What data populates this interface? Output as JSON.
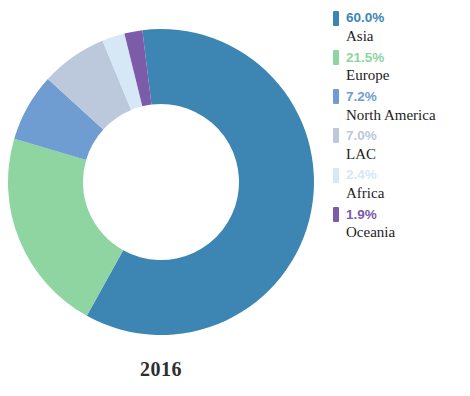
{
  "chart_data": {
    "type": "pie",
    "title": "",
    "subtitle": "",
    "year_label": "2016",
    "hole": 0.51,
    "start_angle_deg": -7.0,
    "direction": "clockwise",
    "legend_position": "right",
    "grid": false,
    "categories": [
      "Asia",
      "Europe",
      "North America",
      "LAC",
      "Africa",
      "Oceania"
    ],
    "values": [
      60.0,
      21.5,
      7.2,
      7.0,
      2.4,
      1.9
    ],
    "value_labels": [
      "60.0%",
      "21.5%",
      "7.2%",
      "7.0%",
      "2.4%",
      "1.9%"
    ],
    "colors": [
      "#3d86b4",
      "#8ed5a2",
      "#6f9dd1",
      "#bcc8dc",
      "#d6e7f6",
      "#7c5ca8"
    ],
    "xlabel": "",
    "ylabel": ""
  },
  "legend": {
    "items": [
      {
        "pct": "60.0%",
        "name": "Asia",
        "color": "#3d86b4"
      },
      {
        "pct": "21.5%",
        "name": "Europe",
        "color": "#8ed5a2"
      },
      {
        "pct": "7.2%",
        "name": "North America",
        "color": "#6f9dd1"
      },
      {
        "pct": "7.0%",
        "name": "LAC",
        "color": "#bcc8dc"
      },
      {
        "pct": "2.4%",
        "name": "Africa",
        "color": "#d6e7f6"
      },
      {
        "pct": "1.9%",
        "name": "Oceania",
        "color": "#7c5ca8"
      }
    ]
  },
  "footer": {
    "year": "2016"
  }
}
